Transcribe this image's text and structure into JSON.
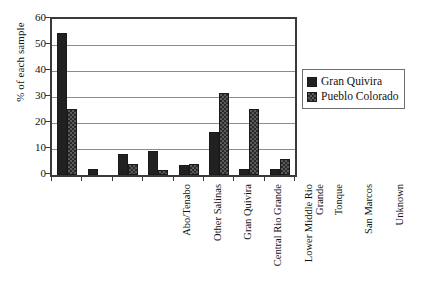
{
  "chart_data": {
    "type": "bar",
    "title": "",
    "xlabel": "",
    "ylabel": "% of each sample",
    "ylim": [
      0,
      60
    ],
    "yticks": [
      0,
      10,
      20,
      30,
      40,
      50,
      60
    ],
    "grid": true,
    "legend_position": "right",
    "categories": [
      "Abo/Tenabo",
      "Other Salinas",
      "Gran Quivira",
      "Central Rio Grande",
      "Lower Middle Rio Grande",
      "Tonque",
      "San Marcos",
      "Unknown"
    ],
    "series": [
      {
        "name": "Gran Quivira",
        "color": "#212121",
        "pattern": "solid",
        "values": [
          54.5,
          2.5,
          8.0,
          9.1,
          3.7,
          16.6,
          2.3,
          2.2
        ]
      },
      {
        "name": "Pueblo Colorado",
        "color": "#5a5a5a",
        "pattern": "checkered",
        "values": [
          25.5,
          0,
          4.3,
          1.9,
          4.1,
          31.5,
          25.2,
          6.1
        ]
      }
    ]
  },
  "axis": {
    "y_title": "% of each sample",
    "y_tick_labels": [
      "60",
      "50",
      "40",
      "30",
      "20",
      "10",
      "0"
    ]
  },
  "legend": {
    "items": [
      {
        "label": "Gran Quivira"
      },
      {
        "label": "Pueblo Colorado"
      }
    ]
  },
  "categories_display": [
    {
      "lines": [
        "Abo/Tenabo"
      ]
    },
    {
      "lines": [
        "Other Salinas"
      ]
    },
    {
      "lines": [
        "Gran Quivira"
      ]
    },
    {
      "lines": [
        "Central Rio Grande"
      ]
    },
    {
      "lines": [
        "Lower Middle Rio",
        "Grande"
      ]
    },
    {
      "lines": [
        "Tonque"
      ]
    },
    {
      "lines": [
        "San Marcos"
      ]
    },
    {
      "lines": [
        "Unknown"
      ]
    }
  ]
}
